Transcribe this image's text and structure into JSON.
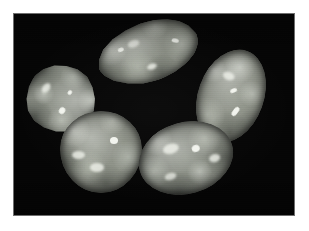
{
  "image": {
    "title": "Five polished tumbled gemstone cabochons on black background",
    "subject": "gemstone-cabochons",
    "background_color": "#050505",
    "page_color": "#ffffff",
    "frame_border_color": "#6e6e6e",
    "width_px": 309,
    "height_px": 231,
    "photo": {
      "left_px": 14,
      "top_px": 14,
      "width_px": 280,
      "height_px": 201
    }
  },
  "stones": [
    {
      "id": "stone-top-teardrop",
      "label": "Top teardrop cabochon",
      "shape": "teardrop",
      "base_color": "#8e9288",
      "highlight_color": "#f2f4ee",
      "shadow_color": "#3c4038",
      "rotation_deg": -18,
      "left_px": 96,
      "top_px": 22,
      "width_px": 104,
      "height_px": 60
    },
    {
      "id": "stone-left-teardrop",
      "label": "Left rounded teardrop cabochon",
      "shape": "teardrop",
      "base_color": "#8b8f86",
      "highlight_color": "#f2f4ee",
      "shadow_color": "#3a3e36",
      "rotation_deg": 128,
      "left_px": 24,
      "top_px": 62,
      "width_px": 70,
      "height_px": 68
    },
    {
      "id": "stone-right-oval",
      "label": "Right elongated oval cabochon",
      "shape": "oval",
      "base_color": "#90948a",
      "highlight_color": "#ffffff",
      "shadow_color": "#3c4038",
      "rotation_deg": 22,
      "left_px": 198,
      "top_px": 48,
      "width_px": 66,
      "height_px": 94
    },
    {
      "id": "stone-bottom-left-dome",
      "label": "Bottom left domed round cabochon",
      "shape": "round",
      "base_color": "#8e9288",
      "highlight_color": "#f4f6f0",
      "shadow_color": "#3a3e36",
      "rotation_deg": 0,
      "left_px": 60,
      "top_px": 111,
      "width_px": 80,
      "height_px": 80
    },
    {
      "id": "stone-bottom-right-oval",
      "label": "Bottom right oval cabochon",
      "shape": "oval",
      "base_color": "#8b8f86",
      "highlight_color": "#f6f8f2",
      "shadow_color": "#3c4038",
      "rotation_deg": -16,
      "left_px": 138,
      "top_px": 122,
      "width_px": 94,
      "height_px": 70
    }
  ]
}
